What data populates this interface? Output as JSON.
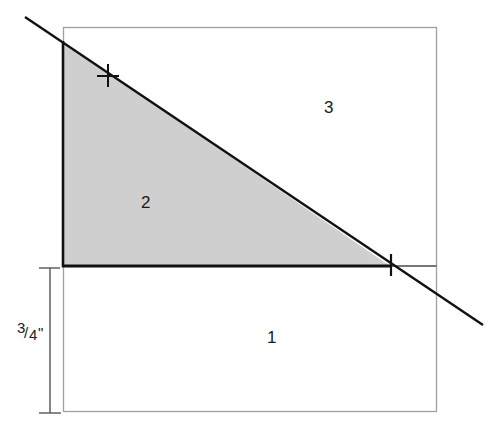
{
  "diagram": {
    "type": "geometric-folding-diagram",
    "regions": [
      {
        "id": "1",
        "label": "1",
        "description": "lower rectangle below fold line"
      },
      {
        "id": "2",
        "label": "2",
        "description": "shaded right triangle"
      },
      {
        "id": "3",
        "label": "3",
        "description": "upper-right region above diagonal"
      }
    ],
    "dimension": {
      "label_numerator": "3",
      "label_slash": "/",
      "label_denominator": "4",
      "label_unit": "\"",
      "full_label": "3/4\""
    },
    "marks": [
      {
        "type": "cross",
        "description": "plus mark on diagonal near top-left"
      },
      {
        "type": "tick",
        "description": "tick mark where diagonal meets horizontal line"
      }
    ],
    "colors": {
      "shade": "#cfcfcf",
      "outline": "#9a9a9a",
      "line": "#111111",
      "background": "#ffffff"
    }
  }
}
